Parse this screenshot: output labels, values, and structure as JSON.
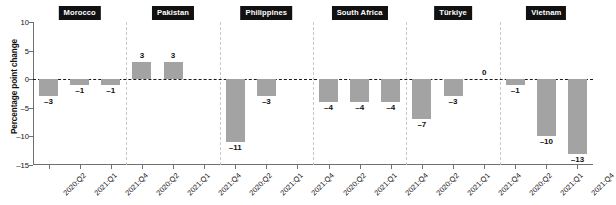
{
  "chart_data": {
    "type": "bar",
    "title": "",
    "xlabel": "",
    "ylabel": "Percentage point change",
    "ylim": [
      -15,
      10
    ],
    "yticks": [
      10,
      5,
      0,
      -5,
      -10,
      -15
    ],
    "ytick_labels": [
      "10",
      "5",
      "0",
      "–5",
      "–10",
      "–15"
    ],
    "grid": false,
    "legend": "none",
    "zero_line": true,
    "bar_color": "#a3a3a3",
    "group_label_color": "#111111",
    "categories": [
      "2020:Q2",
      "2021:Q1",
      "2021:Q4",
      "2020:Q2",
      "2021:Q1",
      "2021:Q4",
      "2020:Q2",
      "2021:Q1",
      "2021:Q4",
      "2020:Q2",
      "2021:Q1",
      "2021:Q4",
      "2020:Q2",
      "2021:Q1",
      "2021:Q4",
      "2020:Q2",
      "2021:Q1",
      "2021:Q4"
    ],
    "groups": [
      {
        "label": "Morocco",
        "points": [
          {
            "x": "2020:Q2",
            "value": -3,
            "label": "–3"
          },
          {
            "x": "2021:Q1",
            "value": -1,
            "label": "–1"
          },
          {
            "x": "2021:Q4",
            "value": -1,
            "label": "–1"
          }
        ]
      },
      {
        "label": "Pakistan",
        "points": [
          {
            "x": "2020:Q2",
            "value": 3,
            "label": "3"
          },
          {
            "x": "2021:Q1",
            "value": 3,
            "label": "3"
          },
          {
            "x": "2021:Q4",
            "value": null,
            "label": ""
          }
        ]
      },
      {
        "label": "Philippines",
        "points": [
          {
            "x": "2020:Q2",
            "value": -11,
            "label": "–11"
          },
          {
            "x": "2021:Q1",
            "value": -3,
            "label": "–3"
          },
          {
            "x": "2021:Q4",
            "value": null,
            "label": ""
          }
        ]
      },
      {
        "label": "South Africa",
        "points": [
          {
            "x": "2020:Q2",
            "value": -4,
            "label": "–4"
          },
          {
            "x": "2021:Q1",
            "value": -4,
            "label": "–4"
          },
          {
            "x": "2021:Q4",
            "value": -4,
            "label": "–4"
          }
        ]
      },
      {
        "label": "Türkiye",
        "points": [
          {
            "x": "2020:Q2",
            "value": -7,
            "label": "–7"
          },
          {
            "x": "2021:Q1",
            "value": -3,
            "label": "–3"
          },
          {
            "x": "2021:Q4",
            "value": 0,
            "label": "0"
          }
        ]
      },
      {
        "label": "Vietnam",
        "points": [
          {
            "x": "2020:Q2",
            "value": -1,
            "label": "–1"
          },
          {
            "x": "2021:Q1",
            "value": -10,
            "label": "–10"
          },
          {
            "x": "2021:Q4",
            "value": -13,
            "label": "–13"
          }
        ]
      }
    ]
  }
}
